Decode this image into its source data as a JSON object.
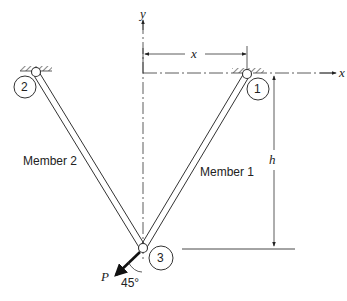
{
  "diagram": {
    "type": "two-member truss",
    "axes": {
      "x_label": "x",
      "y_label": "y"
    },
    "dimensions": {
      "horizontal": "x",
      "vertical": "h"
    },
    "nodes": [
      {
        "id": "1",
        "label": "1",
        "support": "pinned"
      },
      {
        "id": "2",
        "label": "2",
        "support": "pinned"
      },
      {
        "id": "3",
        "label": "3",
        "support": "free"
      }
    ],
    "members": [
      {
        "label": "Member 1",
        "from": "1",
        "to": "3"
      },
      {
        "label": "Member 2",
        "from": "2",
        "to": "3"
      }
    ],
    "load": {
      "label": "P",
      "angle": "45°",
      "at_node": "3"
    }
  }
}
